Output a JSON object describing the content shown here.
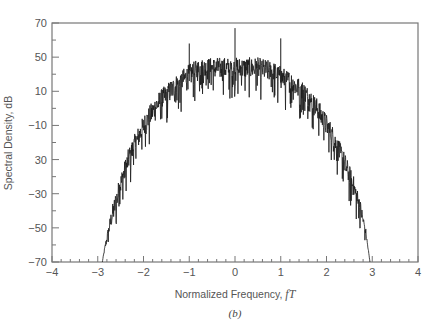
{
  "chart_data": {
    "type": "line",
    "title": "",
    "caption": "(b)",
    "xlabel": "Normalized Frequency, fT",
    "xlabel_text": "Normalized Frequency, ",
    "xlabel_var": "fT",
    "ylabel": "Spectral Density, dB",
    "xlim": [
      -4,
      4
    ],
    "ylim": [
      -70,
      70
    ],
    "x_ticks": [
      -4,
      -3,
      -2,
      -1,
      0,
      1,
      2,
      3,
      4
    ],
    "x_tick_labels": [
      "−4",
      "−3",
      "−2",
      "−1",
      "0",
      "1",
      "2",
      "3",
      "4"
    ],
    "y_tick_positions": [
      70,
      50,
      30,
      10,
      -10,
      -30,
      -50,
      -70
    ],
    "y_tick_labels": [
      "70",
      "50",
      "10",
      "−10",
      "30",
      "−30",
      "−50",
      "−70"
    ],
    "grid": false,
    "legend": null,
    "series": [
      {
        "name": "Spectral Density",
        "color": "#1a1a1a",
        "envelope": {
          "x": [
            -2.9,
            -2.85,
            -2.7,
            -2.5,
            -2.3,
            -2.0,
            -1.7,
            -1.4,
            -1.2,
            -1.0,
            -0.8,
            -0.5,
            0.0,
            0.5,
            0.8,
            1.0,
            1.2,
            1.5,
            1.8,
            2.1,
            2.4,
            2.6,
            2.75,
            2.85,
            2.95
          ],
          "y": [
            -70,
            -62,
            -42,
            -22,
            -5,
            12,
            25,
            33,
            38,
            42,
            45,
            46,
            46,
            46,
            44,
            41,
            38,
            32,
            22,
            8,
            -10,
            -24,
            -38,
            -50,
            -70
          ]
        },
        "spikes": [
          {
            "x": -1.0,
            "y": 58
          },
          {
            "x": 0.0,
            "y": 67
          },
          {
            "x": 1.0,
            "y": 61
          }
        ],
        "noise_amplitude_db": 10
      }
    ]
  }
}
